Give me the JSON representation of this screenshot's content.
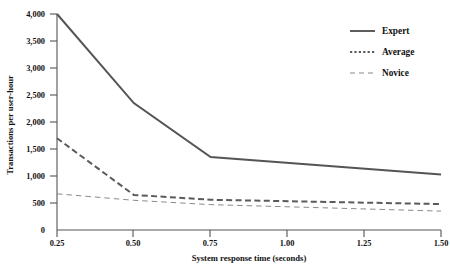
{
  "chart_data": {
    "type": "line",
    "title": "",
    "xlabel": "System response time (seconds)",
    "ylabel": "Transactions per user-hour",
    "x": [
      0.25,
      0.5,
      0.75,
      1.5
    ],
    "xlim": [
      0.25,
      1.5
    ],
    "ylim": [
      0,
      4000
    ],
    "grid": false,
    "legend_position": "top-right",
    "xticks": [
      "0.25",
      "0.50",
      "0.75",
      "1.00",
      "1.25",
      "1.50"
    ],
    "xtick_values": [
      0.25,
      0.5,
      0.75,
      1.0,
      1.25,
      1.5
    ],
    "yticks": [
      "0",
      "500",
      "1,000",
      "1,500",
      "2,000",
      "2,500",
      "3,000",
      "3,500",
      "4,000"
    ],
    "ytick_values": [
      0,
      500,
      1000,
      1500,
      2000,
      2500,
      3000,
      3500,
      4000
    ],
    "series": [
      {
        "name": "Expert",
        "style": "solid",
        "color": "#555555",
        "width": 2.0,
        "values": [
          4000,
          2350,
          1350,
          1030
        ]
      },
      {
        "name": "Average",
        "style": "dashed",
        "color": "#5a5a5a",
        "width": 2.0,
        "values": [
          1700,
          650,
          560,
          480
        ]
      },
      {
        "name": "Novice",
        "style": "dashed-thin",
        "color": "#8a8a8a",
        "width": 1.0,
        "values": [
          670,
          550,
          470,
          350
        ]
      }
    ]
  },
  "legend": {
    "items": [
      {
        "label": "Expert",
        "sample": "solid-line-sample"
      },
      {
        "label": "Average",
        "sample": "dotted-line-sample"
      },
      {
        "label": "Novice",
        "sample": "dashed-line-sample"
      }
    ]
  },
  "axes": {
    "y_title": "Transactions per user-hour",
    "x_title": "System response time (seconds)"
  }
}
